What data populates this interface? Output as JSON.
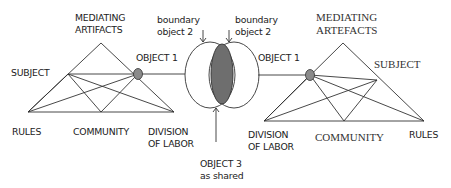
{
  "diagram": {
    "type": "third-generation activity theory (two interacting activity systems)",
    "left_system": {
      "mediating_artifacts": [
        "MEDIATING",
        "ARTIFACTS"
      ],
      "subject": "SUBJECT",
      "object": "OBJECT 1",
      "rules": "RULES",
      "community": "COMMUNITY",
      "division_of_labor": [
        "DIVISION",
        "OF LABOR"
      ]
    },
    "right_system": {
      "mediating_artifacts": [
        "MEDIATING",
        "ARTEFACTS"
      ],
      "subject": "SUBJECT",
      "object": "OBJECT 1",
      "rules": "RULES",
      "community": "COMMUNITY",
      "division_of_labor": [
        "DIVISION",
        "OF LABOR"
      ]
    },
    "boundary_objects": {
      "left": [
        "boundary",
        "object 2"
      ],
      "right": [
        "boundary",
        "object 2"
      ]
    },
    "shared_object": [
      "OBJECT 3",
      "as shared"
    ],
    "colors": {
      "line": "#333333",
      "node_fill": "#8a8a8a",
      "shared_fill": "#6e6e6e",
      "text": "#222222"
    }
  }
}
